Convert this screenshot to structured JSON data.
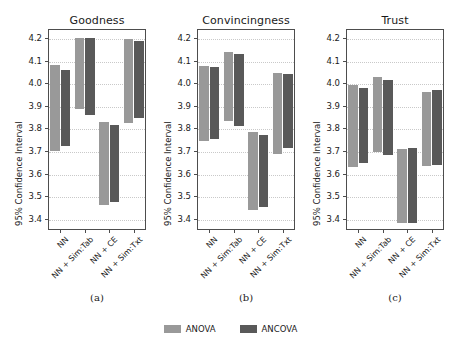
{
  "chart_data": {
    "type": "bar",
    "title": "",
    "subtitle": "",
    "xlabel": "",
    "ylabel": "95% Confidence Interval",
    "ylim": [
      3.35,
      4.24
    ],
    "yticks": [
      3.4,
      3.5,
      3.6,
      3.7,
      3.8,
      3.9,
      4.0,
      4.1,
      4.2
    ],
    "ytick_labels": [
      "3.4",
      "3.5",
      "3.6",
      "3.7",
      "3.8",
      "3.9",
      "4.0",
      "4.1",
      "4.2"
    ],
    "grid": true,
    "legend_position": "bottom-center",
    "legend": [
      "ANOVA",
      "ANCOVA"
    ],
    "colors": {
      "ANOVA": "#999999",
      "ANCOVA": "#595959",
      "axis": "#4d4d4d",
      "grid": "#c9c9c9",
      "background": "#ffffff"
    },
    "categories": [
      "NN",
      "NN + Sim:Tab",
      "NN + CE",
      "NN + Sim:Txt"
    ],
    "panels": [
      {
        "title": "Goodness",
        "caption": "(a)",
        "series": [
          {
            "name": "ANOVA",
            "color": "#999999",
            "intervals": [
              {
                "category": "NN",
                "low": 3.7,
                "high": 4.082
              },
              {
                "category": "NN + Sim:Tab",
                "low": 3.885,
                "high": 4.2
              },
              {
                "category": "NN + CE",
                "low": 3.46,
                "high": 3.83
              },
              {
                "category": "NN + Sim:Txt",
                "low": 3.825,
                "high": 4.195
              }
            ]
          },
          {
            "name": "ANCOVA",
            "color": "#595959",
            "intervals": [
              {
                "category": "NN",
                "low": 3.72,
                "high": 4.06
              },
              {
                "category": "NN + Sim:Tab",
                "low": 3.858,
                "high": 4.2
              },
              {
                "category": "NN + CE",
                "low": 3.476,
                "high": 3.815
              },
              {
                "category": "NN + Sim:Txt",
                "low": 3.845,
                "high": 4.186
              }
            ]
          }
        ]
      },
      {
        "title": "Convincingness",
        "caption": "(b)",
        "series": [
          {
            "name": "ANOVA",
            "color": "#999999",
            "intervals": [
              {
                "category": "NN",
                "low": 3.745,
                "high": 4.078
              },
              {
                "category": "NN + Sim:Tab",
                "low": 3.832,
                "high": 4.136
              },
              {
                "category": "NN + CE",
                "low": 3.44,
                "high": 3.782
              },
              {
                "category": "NN + Sim:Txt",
                "low": 3.685,
                "high": 4.045
              }
            ]
          },
          {
            "name": "ANCOVA",
            "color": "#595959",
            "intervals": [
              {
                "category": "NN",
                "low": 3.752,
                "high": 4.07
              },
              {
                "category": "NN + Sim:Tab",
                "low": 3.81,
                "high": 4.13
              },
              {
                "category": "NN + CE",
                "low": 3.452,
                "high": 3.772
              },
              {
                "category": "NN + Sim:Txt",
                "low": 3.715,
                "high": 4.04
              }
            ]
          }
        ]
      },
      {
        "title": "Trust",
        "caption": "(c)",
        "series": [
          {
            "name": "ANOVA",
            "color": "#999999",
            "intervals": [
              {
                "category": "NN",
                "low": 3.63,
                "high": 3.99
              },
              {
                "category": "NN + Sim:Tab",
                "low": 3.695,
                "high": 4.026
              },
              {
                "category": "NN + CE",
                "low": 3.38,
                "high": 3.71
              },
              {
                "category": "NN + Sim:Txt",
                "low": 3.634,
                "high": 3.96
              }
            ]
          },
          {
            "name": "ANCOVA",
            "color": "#595959",
            "intervals": [
              {
                "category": "NN",
                "low": 3.646,
                "high": 3.978
              },
              {
                "category": "NN + Sim:Tab",
                "low": 3.68,
                "high": 4.012
              },
              {
                "category": "NN + CE",
                "low": 3.38,
                "high": 3.713
              },
              {
                "category": "NN + Sim:Txt",
                "low": 3.638,
                "high": 3.97
              }
            ]
          }
        ]
      }
    ]
  }
}
